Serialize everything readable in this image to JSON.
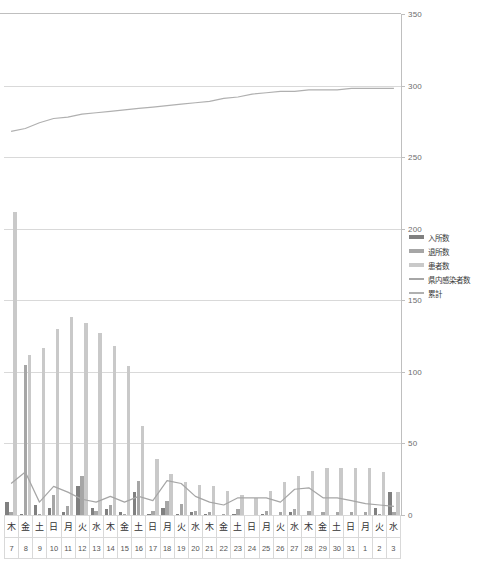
{
  "chart_data": {
    "type": "bar",
    "title": "",
    "xlabel": "",
    "ylabel": "",
    "ylim": [
      0,
      350
    ],
    "ytick_labels": [
      "0",
      "50",
      "100",
      "150",
      "200",
      "250",
      "300",
      "350"
    ],
    "ytick_values": [
      0,
      50,
      100,
      150,
      200,
      250,
      300,
      350
    ],
    "grid": true,
    "legend_position": "right-middle",
    "categories": [
      "木 7",
      "金 8",
      "土 9",
      "日 10",
      "月 11",
      "火 12",
      "水 13",
      "木 14",
      "金 15",
      "土 16",
      "日 17",
      "月 18",
      "火 19",
      "水 20",
      "木 21",
      "金 22",
      "土 23",
      "日 24",
      "月 25",
      "火 26",
      "水 27",
      "木 28",
      "金 29",
      "土 30",
      "日 31",
      "月 1",
      "火 2",
      "水 3"
    ],
    "day_of_week": [
      "木",
      "金",
      "土",
      "日",
      "月",
      "火",
      "水",
      "木",
      "金",
      "土",
      "日",
      "月",
      "火",
      "水",
      "木",
      "金",
      "土",
      "日",
      "月",
      "火",
      "水",
      "木",
      "金",
      "土",
      "日",
      "月",
      "火",
      "水"
    ],
    "day_of_month": [
      "7",
      "8",
      "9",
      "10",
      "11",
      "12",
      "13",
      "14",
      "15",
      "16",
      "17",
      "18",
      "19",
      "20",
      "21",
      "22",
      "23",
      "24",
      "25",
      "26",
      "27",
      "28",
      "29",
      "30",
      "31",
      "1",
      "2",
      "3"
    ],
    "series": [
      {
        "name": "入所数",
        "color": "#808080",
        "type": "bar",
        "values": [
          9,
          1,
          7,
          5,
          2,
          20,
          5,
          4,
          2,
          16,
          1,
          5,
          1,
          2,
          1,
          0,
          1,
          0,
          1,
          0,
          2,
          0,
          0,
          0,
          0,
          0,
          5,
          16
        ]
      },
      {
        "name": "退所数",
        "color": "#a6a6a6",
        "type": "bar",
        "values": [
          2,
          105,
          1,
          14,
          6,
          27,
          3,
          7,
          1,
          24,
          3,
          10,
          8,
          3,
          2,
          1,
          4,
          0,
          3,
          2,
          4,
          3,
          2,
          2,
          2,
          2,
          1,
          2
        ]
      },
      {
        "name": "患者数",
        "color": "#c9c9c9",
        "type": "bar",
        "values": [
          212,
          112,
          117,
          130,
          138,
          134,
          127,
          118,
          104,
          62,
          39,
          29,
          23,
          21,
          20,
          17,
          14,
          12,
          17,
          23,
          27,
          31,
          33,
          33,
          33,
          33,
          30,
          16
        ]
      },
      {
        "name": "県内感染者数",
        "color": "#a6a6a6",
        "type": "line",
        "values": [
          22,
          30,
          9,
          20,
          16,
          11,
          9,
          13,
          9,
          13,
          10,
          24,
          22,
          13,
          9,
          7,
          12,
          12,
          12,
          9,
          18,
          19,
          12,
          12,
          10,
          8,
          7,
          6
        ]
      },
      {
        "name": "累計",
        "color": "#b0b0b0",
        "type": "line",
        "values": [
          268,
          270,
          274,
          277,
          278,
          280,
          281,
          282,
          283,
          284,
          285,
          286,
          287,
          288,
          289,
          291,
          292,
          294,
          295,
          296,
          296,
          297,
          297,
          297,
          298,
          298,
          298,
          298
        ]
      }
    ]
  }
}
